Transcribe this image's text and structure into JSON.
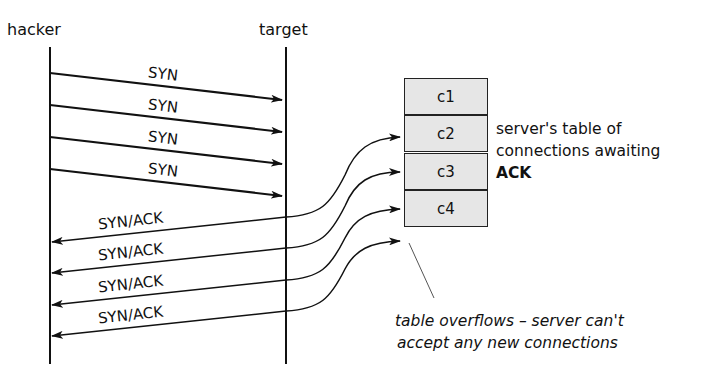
{
  "actors": {
    "left": "hacker",
    "right": "target"
  },
  "syn_messages": [
    "SYN",
    "SYN",
    "SYN",
    "SYN"
  ],
  "synack_messages": [
    "SYN/ACK",
    "SYN/ACK",
    "SYN/ACK",
    "SYN/ACK"
  ],
  "table": {
    "rows": [
      "c1",
      "c2",
      "c3",
      "c4"
    ],
    "fill_color": "#e6e6e6"
  },
  "table_note": {
    "line1": "server's table of",
    "line2": "connections awaiting",
    "line3_bold": "ACK"
  },
  "overflow_note": {
    "line1": "table overflows – server can't",
    "line2": "accept any new connections"
  }
}
